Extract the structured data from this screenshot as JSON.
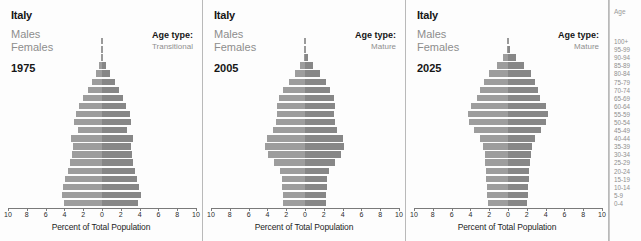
{
  "axis": {
    "title": "Percent of Total Population",
    "tick_labels": [
      "10",
      "8",
      "6",
      "4",
      "2",
      "0",
      "2",
      "4",
      "6",
      "8",
      "10"
    ],
    "tick_values": [
      -10,
      -8,
      -6,
      -4,
      -2,
      0,
      2,
      4,
      6,
      8,
      10
    ],
    "range": [
      -10,
      10
    ]
  },
  "age_legend": {
    "header": "Age",
    "groups": [
      "100+",
      "95-99",
      "90-94",
      "85-89",
      "80-84",
      "75-79",
      "70-74",
      "65-69",
      "60-64",
      "55-59",
      "50-54",
      "45-49",
      "40-44",
      "35-39",
      "30-34",
      "25-29",
      "20-24",
      "15-19",
      "10-14",
      "5-9",
      "0-4"
    ]
  },
  "labels": {
    "males": "Males",
    "females": "Females",
    "age_type_label": "Age type:"
  },
  "colors": {
    "male_bar": "#9d9d9d",
    "female_bar": "#878787",
    "panel_border": "#b9b9b9",
    "text_dark": "#161616",
    "text_gray": "#8d8d8d"
  },
  "chart_data": {
    "type": "bar",
    "subtype": "population-pyramid",
    "xlabel": "Percent of Total Population",
    "ylabel": "Age",
    "xlim": [
      -10,
      10
    ],
    "grid": false,
    "legend_position": "left",
    "categories": [
      "0-4",
      "5-9",
      "10-14",
      "15-19",
      "20-24",
      "25-29",
      "30-34",
      "35-39",
      "40-44",
      "45-49",
      "50-54",
      "55-59",
      "60-64",
      "65-69",
      "70-74",
      "75-79",
      "80-84",
      "85-89",
      "90-94",
      "95-99",
      "100+"
    ],
    "panels": [
      {
        "country": "Italy",
        "year": "1975",
        "age_type": "Transitional",
        "series": [
          {
            "name": "Males",
            "values": [
              4.0,
              4.3,
              4.1,
              3.9,
              3.6,
              3.4,
              3.2,
              3.1,
              3.3,
              2.6,
              3.0,
              2.8,
              2.4,
              2.0,
              1.5,
              1.1,
              0.6,
              0.3,
              0.1,
              0.03,
              0.01
            ]
          },
          {
            "name": "Females",
            "values": [
              3.8,
              4.1,
              3.9,
              3.7,
              3.5,
              3.3,
              3.2,
              3.1,
              3.3,
              2.7,
              3.1,
              3.0,
              2.6,
              2.2,
              1.8,
              1.4,
              0.8,
              0.4,
              0.15,
              0.04,
              0.01
            ]
          }
        ]
      },
      {
        "country": "Italy",
        "year": "2005",
        "age_type": "Mature",
        "series": [
          {
            "name": "Males",
            "values": [
              2.3,
              2.3,
              2.4,
              2.4,
              2.7,
              3.3,
              3.9,
              4.3,
              4.0,
              3.4,
              3.1,
              3.0,
              3.0,
              2.8,
              2.3,
              1.7,
              1.1,
              0.5,
              0.15,
              0.04,
              0.01
            ]
          },
          {
            "name": "Females",
            "values": [
              2.2,
              2.2,
              2.3,
              2.3,
              2.6,
              3.2,
              3.8,
              4.2,
              4.0,
              3.4,
              3.2,
              3.1,
              3.2,
              3.1,
              2.7,
              2.2,
              1.6,
              0.9,
              0.3,
              0.07,
              0.01
            ]
          }
        ]
      },
      {
        "country": "Italy",
        "year": "2025",
        "age_type": "Mature",
        "series": [
          {
            "name": "Males",
            "values": [
              2.1,
              2.2,
              2.2,
              2.3,
              2.3,
              2.4,
              2.5,
              2.7,
              3.0,
              3.6,
              4.1,
              4.3,
              3.9,
              3.3,
              3.0,
              2.6,
              2.0,
              1.2,
              0.5,
              0.12,
              0.02
            ]
          },
          {
            "name": "Females",
            "values": [
              2.0,
              2.1,
              2.1,
              2.2,
              2.2,
              2.3,
              2.4,
              2.6,
              2.9,
              3.5,
              4.0,
              4.3,
              4.0,
              3.4,
              3.2,
              2.9,
              2.4,
              1.7,
              0.8,
              0.25,
              0.05
            ]
          }
        ]
      }
    ]
  }
}
